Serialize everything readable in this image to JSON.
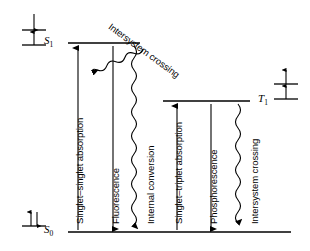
{
  "figure": {
    "type": "jablonski-energy-level-diagram",
    "background_color": "#ffffff",
    "stroke_color": "#000000",
    "width": 310,
    "height": 251
  },
  "levels": [
    {
      "id": "S1",
      "label": "S",
      "subscript": "1",
      "name": "first-excited-singlet-state",
      "line": {
        "x1": 68,
        "x2": 140,
        "y": 43
      },
      "label_pos": {
        "x": 44,
        "y": 36
      }
    },
    {
      "id": "T1",
      "label": "T",
      "subscript": "1",
      "name": "first-excited-triplet-state",
      "line": {
        "x1": 163,
        "x2": 250,
        "y": 101
      },
      "label_pos": {
        "x": 258,
        "y": 94
      }
    },
    {
      "id": "S0",
      "label": "S",
      "subscript": "0",
      "name": "ground-singlet-state",
      "line": {
        "x1": 68,
        "x2": 291,
        "y": 232
      },
      "label_pos": {
        "x": 44,
        "y": 225
      }
    }
  ],
  "spin_diagrams": [
    {
      "id": "spin-S1",
      "name": "spin-configuration-excited-singlet",
      "description": "two separated orbital lines, lower electron spin-up, upper electron spin-up inverted (antiparallel pair)",
      "x": 22,
      "y": 12,
      "orbitals": 2,
      "arrows": [
        "down",
        "up"
      ]
    },
    {
      "id": "spin-T1",
      "name": "spin-configuration-triplet",
      "description": "two separated orbital lines, both electrons spin-up (parallel)",
      "x": 274,
      "y": 72,
      "orbitals": 2,
      "arrows": [
        "up",
        "up"
      ]
    },
    {
      "id": "spin-S0",
      "name": "spin-configuration-ground-singlet",
      "description": "single orbital line with paired electrons up and down",
      "x": 22,
      "y": 210,
      "orbitals": 1,
      "arrows": [
        "up",
        "down"
      ]
    }
  ],
  "transitions": [
    {
      "id": "singlet-singlet-absorption",
      "label": "Singlet–singlet absorption",
      "style": "straight",
      "direction": "up",
      "x": 78,
      "y_from": 230,
      "y_to": 48,
      "label_x": 74,
      "label_y": 222
    },
    {
      "id": "fluorescence",
      "label": "Fluorescence",
      "style": "straight",
      "direction": "down",
      "x": 113,
      "y_from": 46,
      "y_to": 230,
      "label_x": 109,
      "label_y": 222
    },
    {
      "id": "internal-conversion",
      "label": "Internal conversion",
      "style": "wavy",
      "direction": "down",
      "x": 134,
      "y_from": 46,
      "y_to": 230,
      "label_x": 142,
      "label_y": 222
    },
    {
      "id": "intersystem-crossing-S1-T1",
      "label": "Intersystem crossing",
      "style": "wavy",
      "direction": "diagonal-down-right",
      "x_from": 143,
      "y_from": 49,
      "x_to": 166,
      "y_to": 99,
      "label_x": 115,
      "label_y": 22
    },
    {
      "id": "singlet-triplet-absorption",
      "label": "Singlet–triplet absorption",
      "style": "straight",
      "direction": "up",
      "x": 177,
      "y_from": 230,
      "y_to": 106,
      "label_x": 173,
      "label_y": 222
    },
    {
      "id": "phosphorescence",
      "label": "Phosphorescence",
      "style": "straight",
      "direction": "down",
      "x": 211,
      "y_from": 104,
      "y_to": 230,
      "label_x": 207,
      "label_y": 222
    },
    {
      "id": "intersystem-crossing-T1-S0",
      "label": "Intersystem crossing",
      "style": "wavy",
      "direction": "down",
      "x": 238,
      "y_from": 104,
      "y_to": 230,
      "label_x": 246,
      "label_y": 222
    }
  ]
}
